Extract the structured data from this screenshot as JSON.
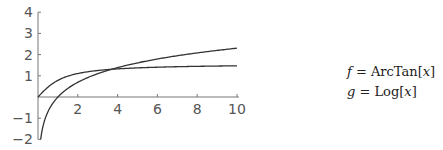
{
  "chart_data": {
    "type": "line",
    "title": "",
    "xlabel": "",
    "ylabel": "",
    "xlim": [
      0,
      10
    ],
    "ylim": [
      -2,
      4
    ],
    "grid": false,
    "legend_position": "right",
    "x_ticks": [
      2,
      4,
      6,
      8,
      10
    ],
    "y_ticks": [
      -2,
      -1,
      1,
      2,
      3,
      4
    ],
    "series": [
      {
        "name": "f = ArcTan[x]",
        "function": "ArcTan",
        "x": [
          0,
          0.5,
          1,
          1.5,
          2,
          3,
          4,
          5,
          6,
          7,
          8,
          9,
          10
        ],
        "values": [
          0,
          0.46,
          0.79,
          0.98,
          1.11,
          1.25,
          1.33,
          1.37,
          1.41,
          1.43,
          1.45,
          1.46,
          1.47
        ]
      },
      {
        "name": "g = Log[x]",
        "function": "Log",
        "x": [
          0.135,
          0.25,
          0.5,
          1,
          1.5,
          2,
          3,
          4,
          5,
          6,
          7,
          8,
          9,
          10
        ],
        "values": [
          -2,
          -1.39,
          -0.69,
          0,
          0.41,
          0.69,
          1.1,
          1.39,
          1.61,
          1.79,
          1.95,
          2.08,
          2.2,
          2.3
        ]
      }
    ],
    "annotations": []
  },
  "legend": {
    "f_var": "f",
    "f_eq": " = ArcTan[",
    "f_arg": "x",
    "f_close": "]",
    "g_var": "g",
    "g_eq": " = Log[",
    "g_arg": "x",
    "g_close": "]"
  },
  "colors": {
    "axis": "#777777",
    "curve": "#333333"
  }
}
